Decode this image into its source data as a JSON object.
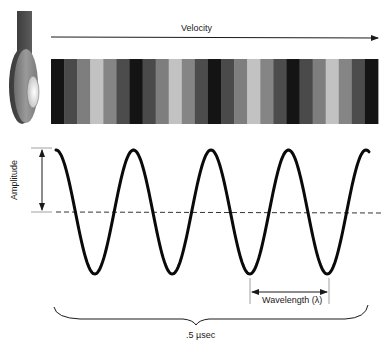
{
  "diagram": {
    "labels": {
      "velocity": "Velocity",
      "amplitude": "Amplitude",
      "wavelength": "Wavelength (λ)",
      "duration": ".5 µsec"
    },
    "transducer": {
      "icon": "ultrasonic-transducer-icon"
    },
    "stripe_bar": {
      "stripe_count": 25,
      "pattern": [
        "#141414",
        "#4a4a4a",
        "#7e7e7e",
        "#c2c2c2",
        "#858585",
        "#4c4c4c"
      ],
      "x": 51,
      "y": 59,
      "width": 327,
      "height": 65
    },
    "waveform": {
      "cycles": 4,
      "start_x": 56,
      "period_px": 77.5,
      "center_y": 212,
      "amplitude_px": 62,
      "stroke": "#0a0a0a"
    },
    "colors": {
      "line": "#1a1a1a",
      "dashed": "#333333",
      "background": "#ffffff"
    }
  }
}
